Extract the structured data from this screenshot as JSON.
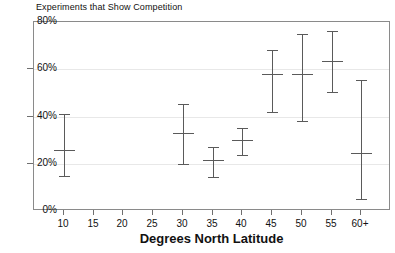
{
  "chart_data": {
    "type": "scatter",
    "title": "Experiments that Show Competition",
    "xlabel": "Degrees North Latitude",
    "ylabel": "",
    "grid": true,
    "legend": null,
    "xlim": [
      5,
      65
    ],
    "ylim": [
      0,
      80
    ],
    "y_unit": "%",
    "yticks": [
      {
        "value": 0,
        "label": "0%"
      },
      {
        "value": 20,
        "label": "20%"
      },
      {
        "value": 40,
        "label": "40%"
      },
      {
        "value": 60,
        "label": "60%"
      },
      {
        "value": 80,
        "label": "80%"
      }
    ],
    "xticks": [
      {
        "value": 10,
        "label": "10"
      },
      {
        "value": 15,
        "label": "15"
      },
      {
        "value": 20,
        "label": "20"
      },
      {
        "value": 25,
        "label": "25"
      },
      {
        "value": 30,
        "label": "30"
      },
      {
        "value": 35,
        "label": "35"
      },
      {
        "value": 40,
        "label": "40"
      },
      {
        "value": 45,
        "label": "45"
      },
      {
        "value": 50,
        "label": "50"
      },
      {
        "value": 55,
        "label": "55"
      },
      {
        "value": 60,
        "label": "60+"
      }
    ],
    "series": [
      {
        "name": "Experiments that Show Competition",
        "marker": "errorbar",
        "color": "#5a5a5a",
        "points": [
          {
            "x": 10,
            "y": 26,
            "low": 15,
            "high": 41
          },
          {
            "x": 30,
            "y": 33,
            "low": 20,
            "high": 45.5
          },
          {
            "x": 35,
            "y": 21.5,
            "low": 14.5,
            "high": 27
          },
          {
            "x": 40,
            "y": 30,
            "low": 23.5,
            "high": 35
          },
          {
            "x": 45,
            "y": 58,
            "low": 42,
            "high": 68
          },
          {
            "x": 50,
            "y": 58,
            "low": 38,
            "high": 75
          },
          {
            "x": 55,
            "y": 63.5,
            "low": 50.5,
            "high": 76
          },
          {
            "x": 60,
            "y": 24.5,
            "low": 5,
            "high": 55.5
          }
        ]
      }
    ]
  }
}
